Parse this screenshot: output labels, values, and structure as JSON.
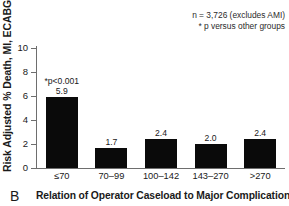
{
  "panel": {
    "letter": "B",
    "title": "Relation of Operator Caseload to Major Complications"
  },
  "annotations": {
    "sample_size": "n = 3,726 (excludes AMI)",
    "p_footnote": "* p versus other groups"
  },
  "chart_data": {
    "type": "bar",
    "title": "Relation of Operator Caseload to Major Complications",
    "xlabel": "Relation of Operator Caseload to Major Complications",
    "ylabel": "Risk Adjusted % Death, MI, ECABG",
    "categories": [
      "≤70",
      "70–99",
      "100–142",
      "143–270",
      ">270"
    ],
    "values": [
      5.9,
      1.7,
      2.4,
      2.0,
      2.4
    ],
    "value_labels": [
      "5.9",
      "1.7",
      "2.4",
      "2.0",
      "2.4"
    ],
    "point_annotations": [
      "*p<0.001",
      "",
      "",
      "",
      ""
    ],
    "ylim": [
      0,
      10
    ],
    "yticks": [
      0,
      2,
      4,
      6,
      8,
      10
    ],
    "ytick_labels": [
      "0",
      "2",
      "4",
      "6",
      "8",
      "10"
    ],
    "grid": false,
    "legend": false,
    "bar_color": "#0a0a0a",
    "axis_color": "#6e6e6e",
    "background": "#ffffff",
    "notes": [
      "n = 3,726 (excludes AMI)",
      "* p versus other groups"
    ]
  }
}
